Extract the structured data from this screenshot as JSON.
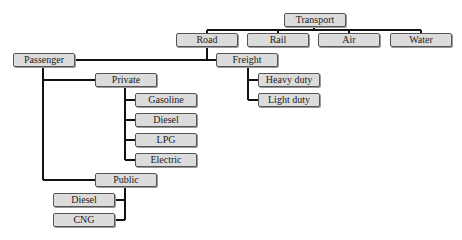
{
  "diagram": {
    "type": "tree",
    "root": "Transport",
    "nodes": {
      "transport": {
        "label": "Transport"
      },
      "road": {
        "label": "Road"
      },
      "rail": {
        "label": "Rail"
      },
      "air": {
        "label": "Air"
      },
      "water": {
        "label": "Water"
      },
      "passenger": {
        "label": "Passenger"
      },
      "freight": {
        "label": "Freight"
      },
      "private": {
        "label": "Private"
      },
      "public": {
        "label": "Public"
      },
      "gasoline": {
        "label": "Gasoline"
      },
      "private_diesel": {
        "label": "Diesel"
      },
      "lpg": {
        "label": "LPG"
      },
      "electric": {
        "label": "Electric"
      },
      "public_diesel": {
        "label": "Diesel"
      },
      "cng": {
        "label": "CNG"
      },
      "heavy_duty": {
        "label": "Heavy duty"
      },
      "light_duty": {
        "label": "Light duty"
      }
    },
    "edges": [
      [
        "Transport",
        "Road"
      ],
      [
        "Transport",
        "Rail"
      ],
      [
        "Transport",
        "Air"
      ],
      [
        "Transport",
        "Water"
      ],
      [
        "Road",
        "Passenger"
      ],
      [
        "Road",
        "Freight"
      ],
      [
        "Passenger",
        "Private"
      ],
      [
        "Passenger",
        "Public"
      ],
      [
        "Private",
        "Gasoline"
      ],
      [
        "Private",
        "Diesel"
      ],
      [
        "Private",
        "LPG"
      ],
      [
        "Private",
        "Electric"
      ],
      [
        "Public",
        "Diesel"
      ],
      [
        "Public",
        "CNG"
      ],
      [
        "Freight",
        "Heavy duty"
      ],
      [
        "Freight",
        "Light duty"
      ]
    ],
    "colors": {
      "box_fill": "#dcdcdc",
      "box_border": "#555555",
      "line": "#111111"
    }
  }
}
